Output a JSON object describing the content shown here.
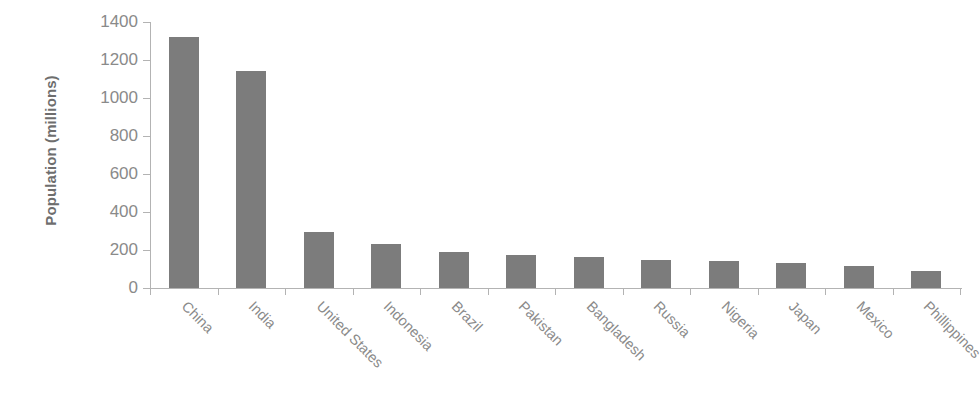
{
  "chart_data": {
    "type": "bar",
    "title": "",
    "subtitle": "",
    "xlabel": "",
    "ylabel": "Population (millions)",
    "ylim": [
      0,
      1400
    ],
    "yticks": [
      0,
      200,
      400,
      600,
      800,
      1000,
      1200,
      1400
    ],
    "grid": false,
    "legend": "none",
    "bar_color": "#7c7c7c",
    "axis_color": "#b3b3b3",
    "text_color": "#8a8a8a",
    "categories": [
      "China",
      "India",
      "United States",
      "Indonesia",
      "Brazil",
      "Pakistan",
      "Bangladesh",
      "Russia",
      "Nigeria",
      "Japan",
      "Mexico",
      "Phillippines"
    ],
    "values": [
      1320,
      1140,
      295,
      230,
      190,
      172,
      165,
      150,
      140,
      130,
      115,
      90
    ],
    "series": [
      {
        "name": "Population",
        "values": [
          1320,
          1140,
          295,
          230,
          190,
          172,
          165,
          150,
          140,
          130,
          115,
          90
        ]
      }
    ]
  }
}
